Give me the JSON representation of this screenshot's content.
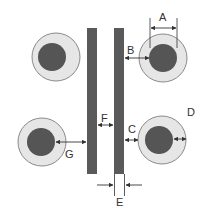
{
  "diagram": {
    "title": "",
    "colors": {
      "background": "#ffffff",
      "pad_ring": "#e6e6e6",
      "pad_ring_stroke": "#8a8a8a",
      "pad_core": "#555555",
      "trace": "#5a5a5a",
      "dimension_line": "#333333",
      "label": "#333333"
    },
    "labels": {
      "A": "A",
      "B": "B",
      "C": "C",
      "D": "D",
      "E": "E",
      "F": "F",
      "G": "G"
    },
    "pads": [
      {
        "id": "top-left",
        "cx": 56,
        "cy": 57,
        "ring_r": 24,
        "core_r": 14,
        "core_dx": -4
      },
      {
        "id": "top-right",
        "cx": 163,
        "cy": 58,
        "ring_r": 24,
        "core_r": 14,
        "core_dx": 0
      },
      {
        "id": "bottom-left",
        "cx": 42,
        "cy": 142,
        "ring_r": 24,
        "core_r": 14,
        "core_dx": -1
      },
      {
        "id": "bottom-right",
        "cx": 162,
        "cy": 140,
        "ring_r": 24,
        "core_r": 14,
        "core_dx": -3
      }
    ],
    "traces": [
      {
        "id": "left-trace",
        "x": 87,
        "y": 28,
        "w": 10,
        "h": 146
      },
      {
        "id": "right-trace",
        "x": 114,
        "y": 28,
        "w": 10,
        "h": 146
      }
    ]
  }
}
